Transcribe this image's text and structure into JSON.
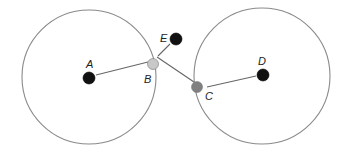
{
  "diagram": {
    "type": "two-circle geometry",
    "colors": {
      "circle_stroke": "#8a8a8a",
      "line_stroke": "#666666",
      "black_point": "#111111",
      "point_B": "#c8c8c8",
      "point_C": "#808080"
    },
    "circles": [
      {
        "id": "left",
        "cx": 89,
        "cy": 77,
        "r": 67
      },
      {
        "id": "right",
        "cx": 262,
        "cy": 76,
        "r": 68
      }
    ],
    "points": [
      {
        "id": "A",
        "label": "A",
        "x": 89,
        "y": 78,
        "r": 6,
        "fill": "#111111",
        "label_x": 86,
        "label_y": 68
      },
      {
        "id": "B",
        "label": "B",
        "x": 153,
        "y": 64,
        "r": 5.5,
        "fill": "#c8c8c8",
        "label_x": 144,
        "label_y": 83
      },
      {
        "id": "C",
        "label": "C",
        "x": 197,
        "y": 87,
        "r": 5.5,
        "fill": "#808080",
        "label_x": 205,
        "label_y": 100
      },
      {
        "id": "D",
        "label": "D",
        "x": 263,
        "y": 75,
        "r": 6,
        "fill": "#111111",
        "label_x": 258,
        "label_y": 65
      },
      {
        "id": "E",
        "label": "E",
        "x": 176,
        "y": 39,
        "r": 6,
        "fill": "#111111",
        "label_x": 160,
        "label_y": 42
      }
    ],
    "segments": [
      {
        "id": "A-B",
        "x1": 96,
        "y1": 75,
        "x2": 148,
        "y2": 62
      },
      {
        "id": "D-C",
        "x1": 256,
        "y1": 76,
        "x2": 207,
        "y2": 87
      },
      {
        "id": "B-C",
        "x1": 157,
        "y1": 57,
        "x2": 194,
        "y2": 82
      },
      {
        "id": "E-B",
        "x1": 158,
        "y1": 56,
        "x2": 170,
        "y2": 44
      }
    ]
  }
}
